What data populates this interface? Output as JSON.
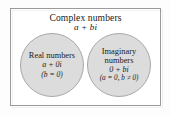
{
  "diagram": {
    "type": "venn-euler-diagram",
    "title": "Complex numbers",
    "title_formula": "a + bi",
    "outer_set": {
      "name": "complex-numbers",
      "label": "Complex numbers",
      "formula": "a + bi"
    },
    "subsets": [
      {
        "name": "real-numbers",
        "label_line1": "Real numbers",
        "formula": "a + 0i",
        "condition": "(b = 0)"
      },
      {
        "name": "imaginary-numbers",
        "label_line1": "Imaginary",
        "label_line2": "numbers",
        "formula": "0 + bi",
        "condition": "(a = 0, b ≠ 0)"
      }
    ],
    "colors": {
      "page_background": "#ffffff",
      "box_border": "#9a9a9a",
      "circle_fill": "#dcdcdc",
      "circle_border": "#a8a8a8",
      "text": "#1a1a1a"
    }
  }
}
